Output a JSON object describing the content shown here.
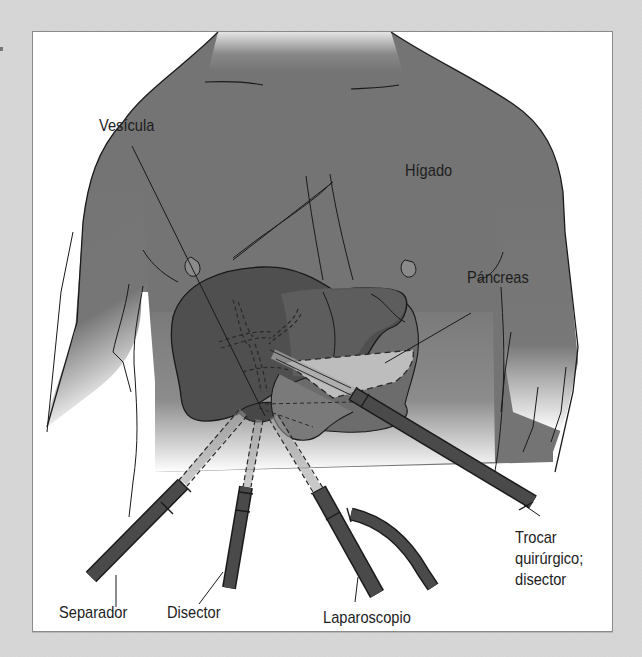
{
  "figure": {
    "type": "anatomical illustration",
    "colors": {
      "page_background": "#d5d5d5",
      "frame_background": "#ffffff",
      "frame_border": "#8a8a8a",
      "body_fill": "#747474",
      "liver_fill": "#4f4f4f",
      "liver_right_lobe_fill": "#5e5e5e",
      "stomach_fill": "#6c6c6c",
      "pancreas_fill": "#bdbdbd",
      "gallbladder_fill": "#474747",
      "instrument_fill": "#4a4a4a",
      "outline": "#1a1a1a",
      "label_text": "#1d1d1d"
    }
  },
  "labels": {
    "vesicula": "Vesícula",
    "higado": "Hígado",
    "pancreas": "Páncreas",
    "separador": "Separador",
    "disector": "Disector",
    "laparoscopio": "Laparoscopio",
    "trocar_line1": "Trocar",
    "trocar_line2": "quirúrgico;",
    "trocar_line3": "disector"
  },
  "instruments": [
    {
      "name": "Separador",
      "entry": "lower-left"
    },
    {
      "name": "Disector",
      "entry": "lower-center-left"
    },
    {
      "name": "Laparoscopio",
      "entry": "lower-center-right",
      "has_side_port": true
    },
    {
      "name": "Trocar quirúrgico; disector",
      "entry": "right"
    }
  ],
  "organs": [
    "Vesícula",
    "Hígado",
    "Páncreas"
  ]
}
